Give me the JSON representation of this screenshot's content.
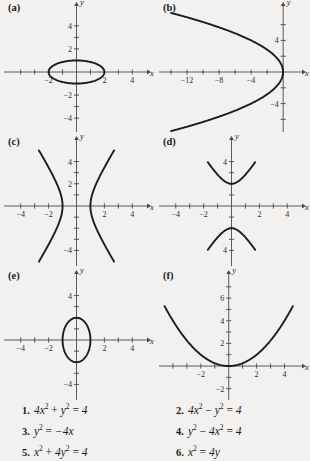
{
  "figure": {
    "background_color": "#f2f1ef",
    "curve_color": "#1d1d1d",
    "axis_color": "#4a4a4a"
  },
  "panels": [
    {
      "label": "(a)",
      "x_axis_name": "x",
      "y_axis_name": "y",
      "x_ticks": [
        -4,
        -3,
        -2,
        -1,
        1,
        2,
        3,
        4
      ],
      "y_ticks": [
        -4,
        -3,
        -2,
        -1,
        1,
        2,
        3,
        4
      ],
      "x_tick_labels": [
        {
          "v": -2,
          "t": "−2"
        },
        {
          "v": 2,
          "t": "2"
        },
        {
          "v": 4,
          "t": "4"
        }
      ],
      "y_tick_labels": [
        {
          "v": 4,
          "t": "4"
        },
        {
          "v": 2,
          "t": "2"
        },
        {
          "v": -2,
          "t": "−2"
        },
        {
          "v": -4,
          "t": "−4"
        }
      ],
      "xlim": [
        -5.2,
        5.2
      ],
      "ylim": [
        -5.2,
        5.2
      ],
      "curve": {
        "kind": "ellipse",
        "a": 2,
        "b": 1,
        "cx": 0,
        "cy": 0
      },
      "equation": "4x² + y² = 4"
    },
    {
      "label": "(b)",
      "x_axis_name": "x",
      "y_axis_name": "y",
      "x_ticks": [
        -14,
        -12,
        -10,
        -8,
        -6,
        -4,
        -2
      ],
      "y_ticks": [
        -6,
        -4,
        -2,
        2,
        4,
        6
      ],
      "x_tick_labels": [
        {
          "v": -12,
          "t": "−12"
        },
        {
          "v": -8,
          "t": "−8"
        },
        {
          "v": -4,
          "t": "−4"
        }
      ],
      "y_tick_labels": [
        {
          "v": 4,
          "t": "4"
        },
        {
          "v": -4,
          "t": "−4"
        }
      ],
      "xlim": [
        -15.5,
        2.6
      ],
      "ylim": [
        -7.6,
        7.6
      ],
      "curve": {
        "kind": "parabola-left",
        "p": 4,
        "xmin": -14.0
      },
      "equation": "y² = −4x"
    },
    {
      "label": "(c)",
      "x_axis_name": "x",
      "y_axis_name": "y",
      "x_ticks": [
        -4,
        -3,
        -2,
        -1,
        1,
        2,
        3,
        4
      ],
      "y_ticks": [
        -4,
        -3,
        -2,
        -1,
        1,
        2,
        3,
        4
      ],
      "x_tick_labels": [
        {
          "v": -4,
          "t": "−4"
        },
        {
          "v": -2,
          "t": "−2"
        },
        {
          "v": 2,
          "t": "2"
        },
        {
          "v": 4,
          "t": "4"
        }
      ],
      "y_tick_labels": [
        {
          "v": 4,
          "t": "4"
        },
        {
          "v": 2,
          "t": "2"
        },
        {
          "v": -4,
          "t": "−4"
        }
      ],
      "xlim": [
        -5.2,
        5.2
      ],
      "ylim": [
        -5.4,
        5.4
      ],
      "curve": {
        "kind": "hyperbola-h",
        "a": 1,
        "b": 2,
        "ymax": 5.0
      },
      "equation": "4x² − y² = 4"
    },
    {
      "label": "(d)",
      "x_axis_name": "x",
      "y_axis_name": "y",
      "x_ticks": [
        -4,
        -3,
        -2,
        -1,
        1,
        2,
        3,
        4
      ],
      "y_ticks": [
        -4,
        -3,
        -2,
        -1,
        1,
        2,
        3,
        4
      ],
      "x_tick_labels": [
        {
          "v": -4,
          "t": "−4"
        },
        {
          "v": -2,
          "t": "−2"
        },
        {
          "v": 2,
          "t": "2"
        },
        {
          "v": 4,
          "t": "4"
        }
      ],
      "y_tick_labels": [
        {
          "v": 4,
          "t": "4"
        },
        {
          "v": -4,
          "t": "4"
        }
      ],
      "xlim": [
        -5.2,
        5.2
      ],
      "ylim": [
        -5.4,
        5.4
      ],
      "curve": {
        "kind": "hyperbola-v",
        "a": 2,
        "b": 1,
        "xmax": 1.7
      },
      "equation": "y² − 4x² = 4"
    },
    {
      "label": "(e)",
      "x_axis_name": "x",
      "y_axis_name": "y",
      "x_ticks": [
        -4,
        -3,
        -2,
        -1,
        1,
        2,
        3,
        4
      ],
      "y_ticks": [
        -4,
        -3,
        -2,
        -1,
        1,
        2,
        3,
        4
      ],
      "x_tick_labels": [
        {
          "v": -4,
          "t": "−4"
        },
        {
          "v": -2,
          "t": "−2"
        },
        {
          "v": 2,
          "t": "2"
        },
        {
          "v": 4,
          "t": "4"
        }
      ],
      "y_tick_labels": [
        {
          "v": 4,
          "t": "4"
        },
        {
          "v": -4,
          "t": "−4"
        }
      ],
      "xlim": [
        -5.2,
        5.2
      ],
      "ylim": [
        -5.4,
        5.4
      ],
      "curve": {
        "kind": "ellipse",
        "a": 1,
        "b": 2,
        "cx": 0,
        "cy": 0
      },
      "equation": "x² + 4y² = 4"
    },
    {
      "label": "(f)",
      "x_axis_name": "x",
      "y_axis_name": "y",
      "x_ticks": [
        -4,
        -3,
        -2,
        -1,
        1,
        2,
        3,
        4
      ],
      "y_ticks": [
        -2,
        -1,
        1,
        2,
        3,
        4,
        5,
        6,
        7
      ],
      "x_tick_labels": [
        {
          "v": -2,
          "t": "−2"
        },
        {
          "v": 2,
          "t": "2"
        },
        {
          "v": 4,
          "t": "4"
        }
      ],
      "y_tick_labels": [
        {
          "v": 6,
          "t": "6"
        },
        {
          "v": 4,
          "t": "4"
        },
        {
          "v": 2,
          "t": "2"
        },
        {
          "v": -2,
          "t": "−2"
        }
      ],
      "xlim": [
        -5.0,
        5.4
      ],
      "ylim": [
        -3.0,
        7.6
      ],
      "curve": {
        "kind": "parabola-up",
        "p": 4,
        "xmin": -4.6,
        "xmax": 4.6
      },
      "equation": "x² = 4y"
    }
  ],
  "equation_list": {
    "left": [
      {
        "num": "1.",
        "lhs_terms": [
          {
            "base": "4x",
            "exp": "2"
          },
          {
            "op": "+"
          },
          {
            "base": "y",
            "exp": "2"
          }
        ],
        "rhs": "4",
        "plain": "4x² + y² = 4"
      },
      {
        "num": "3.",
        "lhs_terms": [
          {
            "base": "y",
            "exp": "2"
          }
        ],
        "rhs": "−4x",
        "plain": "y² = −4x"
      },
      {
        "num": "5.",
        "lhs_terms": [
          {
            "base": "x",
            "exp": "2"
          },
          {
            "op": "+"
          },
          {
            "base": "4y",
            "exp": "2"
          }
        ],
        "rhs": "4",
        "plain": "x² + 4y² = 4"
      }
    ],
    "right": [
      {
        "num": "2.",
        "lhs_terms": [
          {
            "base": "4x",
            "exp": "2"
          },
          {
            "op": "−"
          },
          {
            "base": "y",
            "exp": "2"
          }
        ],
        "rhs": "4",
        "plain": "4x² − y² = 4"
      },
      {
        "num": "4.",
        "lhs_terms": [
          {
            "base": "y",
            "exp": "2"
          },
          {
            "op": "−"
          },
          {
            "base": "4x",
            "exp": "2"
          }
        ],
        "rhs": "4",
        "plain": "y² − 4x² = 4"
      },
      {
        "num": "6.",
        "lhs_terms": [
          {
            "base": "x",
            "exp": "2"
          }
        ],
        "rhs": "4y",
        "plain": "x² = 4y"
      }
    ]
  },
  "chart_data": {
    "type": "line",
    "title": "",
    "panels": [
      {
        "id": "a",
        "curve_type": "ellipse",
        "equation": "4x^2 + y^2 = 4",
        "semi_axis_x": 2,
        "semi_axis_y": 1,
        "center": [
          0,
          0
        ],
        "xlabel": "x",
        "ylabel": "y",
        "xlim": [
          -5.2,
          5.2
        ],
        "ylim": [
          -5.2,
          5.2
        ],
        "xticks": [
          -2,
          2,
          4
        ],
        "yticks": [
          -4,
          -2,
          2,
          4
        ],
        "grid": false
      },
      {
        "id": "b",
        "curve_type": "parabola",
        "equation": "y^2 = -4x",
        "opens": "left",
        "vertex": [
          0,
          0
        ],
        "xlabel": "x",
        "ylabel": "y",
        "xlim": [
          -15.5,
          2.6
        ],
        "ylim": [
          -7.6,
          7.6
        ],
        "xticks": [
          -12,
          -8,
          -4
        ],
        "yticks": [
          -4,
          4
        ],
        "grid": false
      },
      {
        "id": "c",
        "curve_type": "hyperbola",
        "equation": "4x^2 - y^2 = 4",
        "opens": "horizontal",
        "vertices": [
          [
            -1,
            0
          ],
          [
            1,
            0
          ]
        ],
        "xlabel": "x",
        "ylabel": "y",
        "xlim": [
          -5.2,
          5.2
        ],
        "ylim": [
          -5.4,
          5.4
        ],
        "xticks": [
          -4,
          -2,
          2,
          4
        ],
        "yticks": [
          -4,
          2,
          4
        ],
        "grid": false
      },
      {
        "id": "d",
        "curve_type": "hyperbola",
        "equation": "y^2 - 4x^2 = 4",
        "opens": "vertical",
        "vertices": [
          [
            0,
            -2
          ],
          [
            0,
            2
          ]
        ],
        "xlabel": "x",
        "ylabel": "y",
        "xlim": [
          -5.2,
          5.2
        ],
        "ylim": [
          -5.4,
          5.4
        ],
        "xticks": [
          -4,
          -2,
          2,
          4
        ],
        "yticks": [
          4,
          -4
        ],
        "grid": false
      },
      {
        "id": "e",
        "curve_type": "ellipse",
        "equation": "x^2 + 4y^2 = 4",
        "semi_axis_x": 1,
        "semi_axis_y": 2,
        "center": [
          0,
          0
        ],
        "xlabel": "x",
        "ylabel": "y",
        "xlim": [
          -5.2,
          5.2
        ],
        "ylim": [
          -5.4,
          5.4
        ],
        "xticks": [
          -4,
          -2,
          2,
          4
        ],
        "yticks": [
          -4,
          4
        ],
        "grid": false
      },
      {
        "id": "f",
        "curve_type": "parabola",
        "equation": "x^2 = 4y",
        "opens": "up",
        "vertex": [
          0,
          0
        ],
        "xlabel": "x",
        "ylabel": "y",
        "xlim": [
          -5.0,
          5.4
        ],
        "ylim": [
          -3.0,
          7.6
        ],
        "xticks": [
          -2,
          2,
          4
        ],
        "yticks": [
          -2,
          2,
          4,
          6
        ],
        "grid": false
      }
    ]
  }
}
